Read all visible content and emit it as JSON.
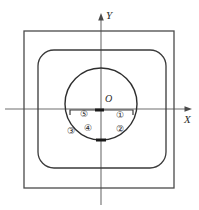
{
  "figure": {
    "background_color": "#ffffff",
    "stroke_color": "#3a3a3a",
    "axis_color": "#5a5a5a",
    "text_color": "#2b2b2b"
  },
  "axes": {
    "x_label": "X",
    "y_label": "Y",
    "origin_label": "O"
  },
  "regions": [
    {
      "id": "region-1",
      "label": "①",
      "cx": 120,
      "cy": 115
    },
    {
      "id": "region-2",
      "label": "②",
      "cx": 120,
      "cy": 129
    },
    {
      "id": "region-3",
      "label": "③",
      "cx": 71,
      "cy": 131
    },
    {
      "id": "region-4",
      "label": "④",
      "cx": 88,
      "cy": 128
    },
    {
      "id": "region-5",
      "label": "⑤",
      "cx": 84,
      "cy": 114
    }
  ],
  "shapes": {
    "outer_square": {
      "x": 24,
      "y": 31,
      "width": 150,
      "height": 157
    },
    "inner_rounded_square": {
      "x": 38,
      "y": 50,
      "width": 128,
      "height": 118,
      "radius": 16
    },
    "circle": {
      "cx": 101,
      "cy": 104,
      "r": 36
    },
    "bracket": {
      "x1": 70,
      "x2": 133,
      "y": 109,
      "tick_height": 6
    }
  }
}
